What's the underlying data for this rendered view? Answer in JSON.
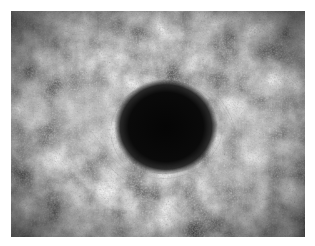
{
  "image": {
    "description": "Grayscale rendering of a black hole surrounded by swirling cloudy, speckled nebula texture",
    "colors": {
      "border": "#ffffff",
      "void": "#080808",
      "cloud_dark": "#2a2a2a",
      "cloud_mid": "#5c5c5c",
      "cloud_light": "#a8a8a8"
    }
  }
}
